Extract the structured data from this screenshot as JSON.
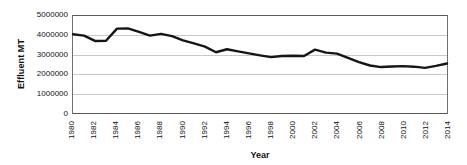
{
  "chart_data": {
    "type": "line",
    "title": "",
    "xlabel": "Year",
    "ylabel": "Effluent MT",
    "x": [
      1980,
      1981,
      1982,
      1983,
      1984,
      1985,
      1986,
      1987,
      1988,
      1989,
      1990,
      1991,
      1992,
      1993,
      1994,
      1995,
      1996,
      1997,
      1998,
      1999,
      2000,
      2001,
      2002,
      2003,
      2004,
      2005,
      2006,
      2007,
      2008,
      2009,
      2010,
      2011,
      2012,
      2013,
      2014
    ],
    "values": [
      4030000,
      3960000,
      3690000,
      3700000,
      4310000,
      4320000,
      4150000,
      3960000,
      4050000,
      3930000,
      3720000,
      3570000,
      3400000,
      3120000,
      3270000,
      3160000,
      3060000,
      2960000,
      2870000,
      2930000,
      2940000,
      2930000,
      3250000,
      3100000,
      3050000,
      2830000,
      2620000,
      2450000,
      2370000,
      2400000,
      2420000,
      2390000,
      2330000,
      2430000,
      2550000
    ],
    "series": [
      {
        "name": "Effluent MT",
        "color": "#161616",
        "values": [
          4030000,
          3960000,
          3690000,
          3700000,
          4310000,
          4320000,
          4150000,
          3960000,
          4050000,
          3930000,
          3720000,
          3570000,
          3400000,
          3120000,
          3270000,
          3160000,
          3060000,
          2960000,
          2870000,
          2930000,
          2940000,
          2930000,
          3250000,
          3100000,
          3050000,
          2830000,
          2620000,
          2450000,
          2370000,
          2400000,
          2420000,
          2390000,
          2330000,
          2430000,
          2550000
        ]
      }
    ],
    "points": [
      {
        "year": 1980,
        "value": 4030000
      },
      {
        "year": 1981,
        "value": 3960000
      },
      {
        "year": 1982,
        "value": 3690000
      },
      {
        "year": 1983,
        "value": 3700000
      },
      {
        "year": 1984,
        "value": 4310000
      },
      {
        "year": 1985,
        "value": 4320000
      },
      {
        "year": 1986,
        "value": 4150000
      },
      {
        "year": 1987,
        "value": 3960000
      },
      {
        "year": 1988,
        "value": 4050000
      },
      {
        "year": 1989,
        "value": 3930000
      },
      {
        "year": 1990,
        "value": 3720000
      },
      {
        "year": 1991,
        "value": 3570000
      },
      {
        "year": 1992,
        "value": 3400000
      },
      {
        "year": 1993,
        "value": 3120000
      },
      {
        "year": 1994,
        "value": 3270000
      },
      {
        "year": 1995,
        "value": 3160000
      },
      {
        "year": 1996,
        "value": 3060000
      },
      {
        "year": 1997,
        "value": 2960000
      },
      {
        "year": 1998,
        "value": 2870000
      },
      {
        "year": 1999,
        "value": 2930000
      },
      {
        "year": 2000,
        "value": 2940000
      },
      {
        "year": 2001,
        "value": 2930000
      },
      {
        "year": 2002,
        "value": 3250000
      },
      {
        "year": 2003,
        "value": 3100000
      },
      {
        "year": 2004,
        "value": 3050000
      },
      {
        "year": 2005,
        "value": 2830000
      },
      {
        "year": 2006,
        "value": 2620000
      },
      {
        "year": 2007,
        "value": 2450000
      },
      {
        "year": 2008,
        "value": 2370000
      },
      {
        "year": 2009,
        "value": 2400000
      },
      {
        "year": 2010,
        "value": 2420000
      },
      {
        "year": 2011,
        "value": 2390000
      },
      {
        "year": 2012,
        "value": 2330000
      },
      {
        "year": 2013,
        "value": 2430000
      },
      {
        "year": 2014,
        "value": 2550000
      }
    ],
    "xlim": [
      1980,
      2014
    ],
    "ylim": [
      0,
      5000000
    ],
    "y_ticks": [
      0,
      1000000,
      2000000,
      3000000,
      4000000,
      5000000
    ],
    "y_tick_labels": [
      "0",
      "1000000",
      "2000000",
      "3000000",
      "4000000",
      "5000000"
    ],
    "x_ticks": [
      1980,
      1982,
      1984,
      1986,
      1988,
      1990,
      1992,
      1994,
      1996,
      1998,
      2000,
      2002,
      2004,
      2006,
      2008,
      2010,
      2012,
      2014
    ],
    "x_tick_labels": [
      "1980",
      "1982",
      "1984",
      "1986",
      "1988",
      "1990",
      "1992",
      "1994",
      "1996",
      "1998",
      "2000",
      "2002",
      "2004",
      "2006",
      "2008",
      "2010",
      "2012",
      "2014"
    ],
    "grid": true,
    "grid_color": "#c8c8c8",
    "legend": false,
    "legend_position": "none",
    "line_color": "#161616",
    "line_width": 2.4,
    "markers": false,
    "background": "#ffffff"
  }
}
